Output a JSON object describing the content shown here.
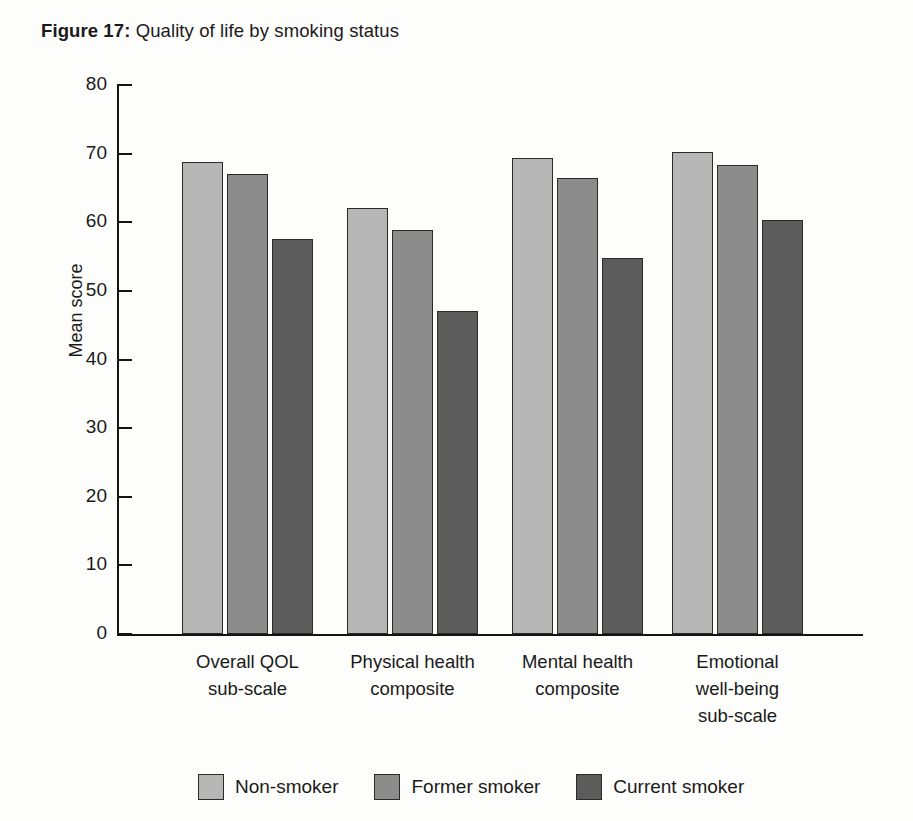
{
  "figure": {
    "label": "Figure 17:",
    "caption": " Quality of life by smoking status"
  },
  "chart_data": {
    "type": "bar",
    "title": "Quality of life by smoking status",
    "xlabel": "",
    "ylabel": "Mean score",
    "ylim": [
      0,
      80
    ],
    "yticks": [
      "0",
      "10",
      "20",
      "30",
      "40",
      "50",
      "60",
      "70",
      "80"
    ],
    "grid": false,
    "legend_position": "bottom",
    "categories": [
      "Overall QOL sub-scale",
      "Physical health composite",
      "Mental health composite",
      "Emotional well-being sub-scale"
    ],
    "category_lines": [
      [
        "Overall QOL",
        "sub-scale"
      ],
      [
        "Physical health",
        "composite"
      ],
      [
        "Mental health",
        "composite"
      ],
      [
        "Emotional",
        "well-being",
        "sub-scale"
      ]
    ],
    "series": [
      {
        "name": "Non-smoker",
        "color": "#b6b6b6",
        "values": [
          68.8,
          62.1,
          69.4,
          70.3
        ]
      },
      {
        "name": "Former smoker",
        "color": "#8c8c8c",
        "values": [
          67.0,
          58.9,
          66.4,
          68.3
        ]
      },
      {
        "name": "Current smoker",
        "color": "#5c5c5c",
        "values": [
          57.6,
          47.0,
          54.8,
          60.4
        ]
      }
    ]
  },
  "legend": [
    {
      "label": "Non-smoker",
      "color": "#b6b6b6"
    },
    {
      "label": "Former smoker",
      "color": "#8c8c8c"
    },
    {
      "label": "Current smoker",
      "color": "#5c5c5c"
    }
  ]
}
